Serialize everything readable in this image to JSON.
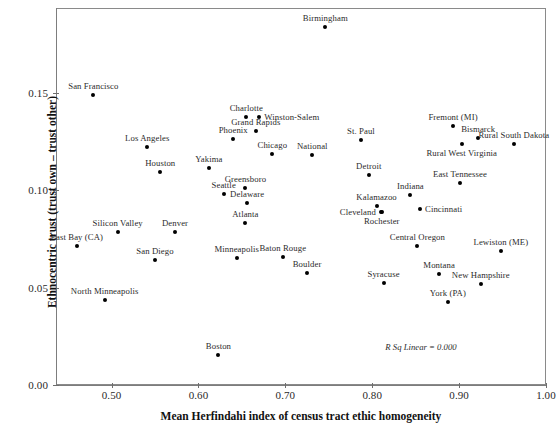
{
  "chart_data": {
    "type": "scatter",
    "title": "",
    "xlabel": "Mean Herfindahi index of census tract ethic homogeneity",
    "ylabel": "Ethnocentric trust (trust own – trust other)",
    "xlim": [
      0.436,
      1.0
    ],
    "ylim": [
      0.0,
      0.1935
    ],
    "grid": false,
    "legend": null,
    "annotation": "R Sq Linear = 0.000",
    "xticks": [
      0.5,
      0.6,
      0.7,
      0.8,
      0.9,
      1.0
    ],
    "xtick_labels": [
      "0.50",
      "0.60",
      "0.70",
      "0.80",
      "0.90",
      "1.00"
    ],
    "yticks": [
      0.0,
      0.05,
      0.1,
      0.15
    ],
    "ytick_labels": [
      "0.00",
      "0.05",
      "0.10",
      "0.15"
    ],
    "points": [
      {
        "label": "San Francisco",
        "x": 0.479,
        "y": 0.149,
        "pos": "top"
      },
      {
        "label": "Birmingham",
        "x": 0.746,
        "y": 0.1835,
        "pos": "top"
      },
      {
        "label": "Charlotte",
        "x": 0.655,
        "y": 0.1375,
        "pos": "top"
      },
      {
        "label": "Winston-Salem",
        "x": 0.67,
        "y": 0.1375,
        "pos": "right"
      },
      {
        "label": "Grand Rapids",
        "x": 0.666,
        "y": 0.1305,
        "pos": "top"
      },
      {
        "label": "Fremont (MI)",
        "x": 0.893,
        "y": 0.133,
        "pos": "top"
      },
      {
        "label": "Bismarck",
        "x": 0.922,
        "y": 0.127,
        "pos": "top"
      },
      {
        "label": "Rural South Dakota",
        "x": 0.963,
        "y": 0.1235,
        "pos": "top"
      },
      {
        "label": "Phoenix",
        "x": 0.64,
        "y": 0.1265,
        "pos": "top"
      },
      {
        "label": "St. Paul",
        "x": 0.787,
        "y": 0.126,
        "pos": "top"
      },
      {
        "label": "Los Angeles",
        "x": 0.541,
        "y": 0.122,
        "pos": "top"
      },
      {
        "label": "Chicago",
        "x": 0.685,
        "y": 0.1185,
        "pos": "top"
      },
      {
        "label": "National",
        "x": 0.731,
        "y": 0.118,
        "pos": "top"
      },
      {
        "label": "Rural West Virginia",
        "x": 0.903,
        "y": 0.1235,
        "pos": "bottom"
      },
      {
        "label": "Houston",
        "x": 0.556,
        "y": 0.1095,
        "pos": "top"
      },
      {
        "label": "Yakima",
        "x": 0.612,
        "y": 0.1115,
        "pos": "top"
      },
      {
        "label": "Detroit",
        "x": 0.796,
        "y": 0.108,
        "pos": "top"
      },
      {
        "label": "East Tennessee",
        "x": 0.901,
        "y": 0.1035,
        "pos": "top"
      },
      {
        "label": "Greensboro",
        "x": 0.654,
        "y": 0.101,
        "pos": "top"
      },
      {
        "label": "Seattle",
        "x": 0.629,
        "y": 0.098,
        "pos": "top"
      },
      {
        "label": "Delaware",
        "x": 0.656,
        "y": 0.0935,
        "pos": "top"
      },
      {
        "label": "Indiana",
        "x": 0.844,
        "y": 0.0975,
        "pos": "top"
      },
      {
        "label": "Kalamazoo",
        "x": 0.805,
        "y": 0.092,
        "pos": "top"
      },
      {
        "label": "Cincinnati",
        "x": 0.855,
        "y": 0.0905,
        "pos": "right"
      },
      {
        "label": "Cleveland",
        "x": 0.81,
        "y": 0.089,
        "pos": "left"
      },
      {
        "label": "Rochester",
        "x": 0.811,
        "y": 0.089,
        "pos": "bottom"
      },
      {
        "label": "Atlanta",
        "x": 0.654,
        "y": 0.083,
        "pos": "top"
      },
      {
        "label": "Denver",
        "x": 0.573,
        "y": 0.0785,
        "pos": "top"
      },
      {
        "label": "Silicon Valley",
        "x": 0.507,
        "y": 0.0785,
        "pos": "top"
      },
      {
        "label": "East Bay (CA)",
        "x": 0.46,
        "y": 0.0715,
        "pos": "top"
      },
      {
        "label": "Central Oregon",
        "x": 0.852,
        "y": 0.0715,
        "pos": "top"
      },
      {
        "label": "Lewiston (ME)",
        "x": 0.948,
        "y": 0.069,
        "pos": "top"
      },
      {
        "label": "Minneapolis",
        "x": 0.644,
        "y": 0.065,
        "pos": "top"
      },
      {
        "label": "San Diego",
        "x": 0.55,
        "y": 0.064,
        "pos": "top"
      },
      {
        "label": "Baton Rouge",
        "x": 0.697,
        "y": 0.0655,
        "pos": "top"
      },
      {
        "label": "Boulder",
        "x": 0.725,
        "y": 0.0575,
        "pos": "top"
      },
      {
        "label": "Montana",
        "x": 0.877,
        "y": 0.057,
        "pos": "top"
      },
      {
        "label": "Syracuse",
        "x": 0.813,
        "y": 0.0525,
        "pos": "top"
      },
      {
        "label": "New Hampshire",
        "x": 0.925,
        "y": 0.052,
        "pos": "top"
      },
      {
        "label": "North Minneapolis",
        "x": 0.492,
        "y": 0.0435,
        "pos": "top"
      },
      {
        "label": "York (PA)",
        "x": 0.887,
        "y": 0.0425,
        "pos": "top"
      },
      {
        "label": "Boston",
        "x": 0.623,
        "y": 0.0155,
        "pos": "top"
      }
    ]
  }
}
